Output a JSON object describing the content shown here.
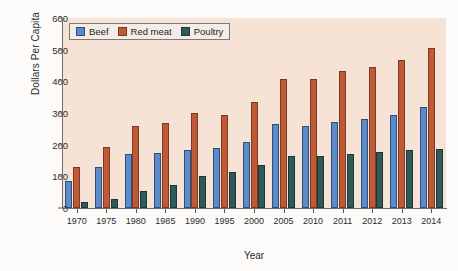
{
  "chart_data": {
    "type": "bar",
    "title": "",
    "xlabel": "Year",
    "ylabel": "Dollars Per Capita",
    "categories": [
      "1970",
      "1975",
      "1980",
      "1985",
      "1990",
      "1995",
      "2000",
      "2005",
      "2010",
      "2011",
      "2012",
      "2013",
      "2014"
    ],
    "series": [
      {
        "name": "Beef",
        "color": "#5b8bc9",
        "values": [
          85,
          130,
          172,
          175,
          182,
          188,
          208,
          265,
          258,
          272,
          282,
          293,
          320
        ]
      },
      {
        "name": "Red meat",
        "color": "#bf5a37",
        "values": [
          128,
          192,
          260,
          268,
          300,
          293,
          335,
          408,
          407,
          432,
          445,
          467,
          505
        ]
      },
      {
        "name": "Poultry",
        "color": "#2f5a59",
        "values": [
          18,
          30,
          55,
          72,
          100,
          113,
          135,
          165,
          165,
          172,
          178,
          182,
          185
        ]
      }
    ],
    "ylim": [
      0,
      600
    ],
    "yticks": [
      0,
      100,
      200,
      300,
      400,
      500,
      600
    ],
    "ytick_labels": [
      "0",
      "100",
      "200",
      "300",
      "400",
      "500",
      "600"
    ],
    "grid": false,
    "legend_position": "upper left",
    "plot_background": "#f7e2d6",
    "figure_background": "#fcfbf9"
  },
  "legend": {
    "items": [
      {
        "label": "Beef"
      },
      {
        "label": "Red meat"
      },
      {
        "label": "Poultry"
      }
    ]
  },
  "axes": {
    "y_title": "Dollars Per Capita",
    "x_title": "Year"
  }
}
